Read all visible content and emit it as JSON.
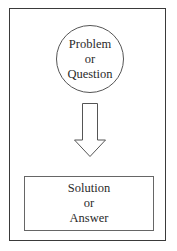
{
  "diagram": {
    "start_node": {
      "shape": "circle",
      "lines": [
        "Problem",
        "or",
        "Question"
      ]
    },
    "connector": {
      "type": "block-arrow",
      "direction": "down"
    },
    "end_node": {
      "shape": "rectangle",
      "lines": [
        "Solution",
        "or",
        "Answer"
      ]
    },
    "colors": {
      "frame": "#3a3a3a",
      "stroke": "#555555",
      "background": "#ffffff",
      "text": "#2a2a2a"
    }
  }
}
